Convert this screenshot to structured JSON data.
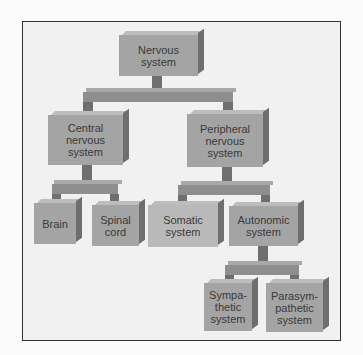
{
  "diagram": {
    "nodes": [
      {
        "id": "nervous",
        "label": "Nervous\nsystem"
      },
      {
        "id": "central",
        "label": "Central\nnervous\nsystem"
      },
      {
        "id": "peripheral",
        "label": "Peripheral\nnervous\nsystem"
      },
      {
        "id": "brain",
        "label": "Brain"
      },
      {
        "id": "spinal",
        "label": "Spinal\ncord"
      },
      {
        "id": "somatic",
        "label": "Somatic\nsystem"
      },
      {
        "id": "autonomic",
        "label": "Autonomic\nsystem"
      },
      {
        "id": "sympathetic",
        "label": "Sympa-\nthetic\nsystem"
      },
      {
        "id": "parasympathetic",
        "label": "Parasym-\npathetic\nsystem"
      }
    ],
    "edges": [
      [
        "nervous",
        "central"
      ],
      [
        "nervous",
        "peripheral"
      ],
      [
        "central",
        "brain"
      ],
      [
        "central",
        "spinal"
      ],
      [
        "peripheral",
        "somatic"
      ],
      [
        "peripheral",
        "autonomic"
      ],
      [
        "autonomic",
        "sympathetic"
      ],
      [
        "autonomic",
        "parasympathetic"
      ]
    ]
  },
  "colors": {
    "box": "#a4a4a4",
    "box_light": "#b9b9b9",
    "text": "#3a3a3a",
    "frame": "#333333"
  }
}
